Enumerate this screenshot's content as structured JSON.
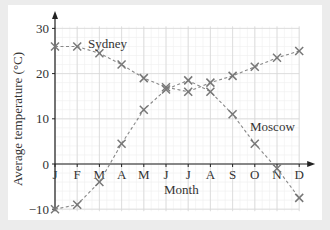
{
  "chart_data": {
    "type": "line",
    "title": "",
    "xlabel": "Month",
    "ylabel": "Average temperature (°C)",
    "categories": [
      "J",
      "F",
      "M",
      "A",
      "M",
      "J",
      "J",
      "A",
      "S",
      "O",
      "N",
      "D"
    ],
    "ylim": [
      -10,
      30
    ],
    "yticks": [
      -10,
      0,
      10,
      20,
      30
    ],
    "grid": true,
    "legend": "inline labels",
    "series": [
      {
        "name": "Sydney",
        "values": [
          26,
          26,
          24.5,
          22,
          19,
          17,
          16,
          18,
          19.5,
          21.5,
          23.5,
          25
        ]
      },
      {
        "name": "Moscow",
        "values": [
          -10,
          -9,
          -4,
          4.5,
          12,
          16.5,
          18.5,
          16,
          11,
          4.5,
          -1,
          -7.5
        ]
      }
    ],
    "marker": "x",
    "line_style": "dashed",
    "line_color": "#888888",
    "marker_color": "#777777",
    "grid_major_color": "#d8d8d8",
    "grid_minor_color": "#eeeeee"
  },
  "labels": {
    "sydney": "Sydney",
    "moscow": "Moscow",
    "xlabel": "Month",
    "ylabel": "Average temperature (°C)"
  }
}
